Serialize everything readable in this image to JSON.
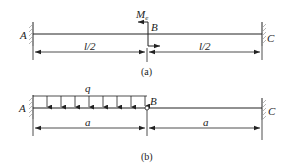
{
  "figure_a": {
    "caption": "(a)",
    "points": {
      "left": "A",
      "middle": "B",
      "right": "C"
    },
    "moment_label": "M",
    "moment_subscript": "e",
    "span_left": "l/2",
    "span_right": "l/2"
  },
  "figure_b": {
    "caption": "(b)",
    "points": {
      "left": "A",
      "middle": "B",
      "right": "C"
    },
    "load_label": "q",
    "span_left": "a",
    "span_right": "a"
  },
  "colors": {
    "ink": "#222222",
    "hatch": "#888888",
    "background": "#ffffff"
  }
}
